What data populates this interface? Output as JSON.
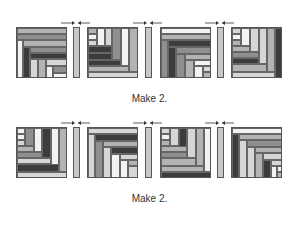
{
  "colors": {
    "white": "#f2f2f2",
    "light": "#d6d6d6",
    "mid": "#b3b3b3",
    "medium": "#8f8f8f",
    "dark": "#3c3c3c"
  },
  "rows": [
    {
      "caption": "Make 2.",
      "blocks": [
        {
          "name": "block-1",
          "x": 16,
          "y": 27,
          "w": 51,
          "h": 51,
          "pieces": [
            [
              0,
              0,
              51,
              6,
              "mid"
            ],
            [
              0,
              6,
              51,
              6,
              "medium"
            ],
            [
              0,
              12,
              6,
              39,
              "white"
            ],
            [
              6,
              12,
              45,
              7,
              "mid"
            ],
            [
              6,
              19,
              7,
              32,
              "dark"
            ],
            [
              13,
              19,
              38,
              6,
              "medium"
            ],
            [
              13,
              25,
              38,
              6,
              "dark"
            ],
            [
              13,
              31,
              8,
              20,
              "light"
            ],
            [
              21,
              31,
              8,
              20,
              "mid"
            ],
            [
              29,
              31,
              22,
              7,
              "light"
            ],
            [
              29,
              38,
              7,
              13,
              "white"
            ],
            [
              36,
              38,
              15,
              7,
              "medium"
            ],
            [
              36,
              45,
              15,
              6,
              "white"
            ]
          ]
        },
        {
          "name": "block-2",
          "x": 87,
          "y": 27,
          "w": 51,
          "h": 51,
          "pieces": [
            [
              0,
              0,
              9,
              6,
              "mid"
            ],
            [
              0,
              6,
              9,
              6,
              "white"
            ],
            [
              0,
              12,
              9,
              6,
              "light"
            ],
            [
              9,
              0,
              8,
              18,
              "white"
            ],
            [
              17,
              0,
              7,
              18,
              "light"
            ],
            [
              0,
              18,
              24,
              7,
              "dark"
            ],
            [
              0,
              25,
              24,
              7,
              "dark"
            ],
            [
              24,
              0,
              9,
              32,
              "medium"
            ],
            [
              33,
              0,
              8,
              38,
              "white"
            ],
            [
              0,
              32,
              33,
              6,
              "dark"
            ],
            [
              0,
              38,
              41,
              6,
              "mid"
            ],
            [
              41,
              0,
              10,
              44,
              "mid"
            ],
            [
              0,
              44,
              51,
              7,
              "light"
            ]
          ]
        },
        {
          "name": "block-3",
          "x": 160,
          "y": 27,
          "w": 51,
          "h": 51,
          "pieces": [
            [
              0,
              0,
              51,
              6,
              "white"
            ],
            [
              0,
              6,
              51,
              6,
              "mid"
            ],
            [
              0,
              12,
              7,
              39,
              "medium"
            ],
            [
              7,
              12,
              44,
              7,
              "dark"
            ],
            [
              7,
              19,
              8,
              32,
              "dark"
            ],
            [
              15,
              19,
              36,
              7,
              "medium"
            ],
            [
              15,
              26,
              9,
              25,
              "medium"
            ],
            [
              24,
              26,
              27,
              6,
              "mid"
            ],
            [
              24,
              32,
              9,
              19,
              "mid"
            ],
            [
              33,
              32,
              18,
              6,
              "white"
            ],
            [
              33,
              38,
              9,
              13,
              "white"
            ],
            [
              42,
              38,
              9,
              6,
              "light"
            ],
            [
              42,
              44,
              9,
              7,
              "mid"
            ]
          ]
        },
        {
          "name": "block-4",
          "x": 231,
          "y": 27,
          "w": 51,
          "h": 51,
          "pieces": [
            [
              0,
              0,
              9,
              6,
              "light"
            ],
            [
              0,
              6,
              9,
              6,
              "white"
            ],
            [
              0,
              12,
              9,
              6,
              "mid"
            ],
            [
              9,
              0,
              9,
              18,
              "white"
            ],
            [
              18,
              0,
              9,
              24,
              "light"
            ],
            [
              0,
              18,
              18,
              6,
              "mid"
            ],
            [
              0,
              24,
              27,
              6,
              "medium"
            ],
            [
              27,
              0,
              8,
              36,
              "light"
            ],
            [
              0,
              30,
              27,
              6,
              "dark"
            ],
            [
              35,
              0,
              8,
              44,
              "mid"
            ],
            [
              0,
              36,
              35,
              8,
              "mid"
            ],
            [
              43,
              0,
              8,
              51,
              "dark"
            ],
            [
              0,
              44,
              43,
              7,
              "light"
            ]
          ]
        }
      ],
      "strips": [
        {
          "x": 73,
          "y": 27
        },
        {
          "x": 145,
          "y": 27
        },
        {
          "x": 217,
          "y": 27
        }
      ],
      "caption_y": 93
    },
    {
      "caption": "Make 2.",
      "blocks": [
        {
          "name": "block-5",
          "x": 16,
          "y": 127,
          "w": 51,
          "h": 51,
          "pieces": [
            [
              0,
              0,
              8,
              6,
              "white"
            ],
            [
              0,
              6,
              8,
              6,
              "white"
            ],
            [
              0,
              12,
              8,
              6,
              "light"
            ],
            [
              8,
              0,
              9,
              18,
              "medium"
            ],
            [
              17,
              0,
              8,
              24,
              "white"
            ],
            [
              0,
              18,
              17,
              6,
              "mid"
            ],
            [
              25,
              0,
              9,
              30,
              "dark"
            ],
            [
              0,
              24,
              25,
              6,
              "medium"
            ],
            [
              0,
              30,
              34,
              6,
              "light"
            ],
            [
              34,
              0,
              8,
              44,
              "white"
            ],
            [
              0,
              36,
              42,
              8,
              "dark"
            ],
            [
              42,
              0,
              9,
              44,
              "mid"
            ],
            [
              0,
              44,
              51,
              7,
              "light"
            ]
          ]
        },
        {
          "name": "block-6",
          "x": 87,
          "y": 127,
          "w": 51,
          "h": 51,
          "pieces": [
            [
              0,
              0,
              51,
              6,
              "light"
            ],
            [
              0,
              6,
              7,
              45,
              "light"
            ],
            [
              7,
              6,
              44,
              7,
              "dark"
            ],
            [
              7,
              13,
              8,
              38,
              "medium"
            ],
            [
              15,
              13,
              36,
              6,
              "mid"
            ],
            [
              15,
              19,
              8,
              32,
              "light"
            ],
            [
              23,
              19,
              28,
              7,
              "dark"
            ],
            [
              23,
              26,
              9,
              25,
              "white"
            ],
            [
              32,
              26,
              19,
              6,
              "light"
            ],
            [
              32,
              32,
              8,
              19,
              "white"
            ],
            [
              40,
              32,
              11,
              6,
              "mid"
            ],
            [
              40,
              38,
              11,
              13,
              "light"
            ]
          ]
        },
        {
          "name": "block-7",
          "x": 160,
          "y": 127,
          "w": 51,
          "h": 51,
          "pieces": [
            [
              0,
              0,
              9,
              6,
              "light"
            ],
            [
              0,
              6,
              9,
              6,
              "white"
            ],
            [
              0,
              12,
              9,
              6,
              "mid"
            ],
            [
              9,
              0,
              9,
              18,
              "light"
            ],
            [
              18,
              0,
              8,
              24,
              "dark"
            ],
            [
              0,
              18,
              26,
              6,
              "mid"
            ],
            [
              0,
              24,
              26,
              6,
              "medium"
            ],
            [
              26,
              0,
              9,
              30,
              "light"
            ],
            [
              35,
              0,
              8,
              38,
              "mid"
            ],
            [
              0,
              30,
              35,
              8,
              "mid"
            ],
            [
              43,
              0,
              8,
              44,
              "white"
            ],
            [
              0,
              38,
              43,
              6,
              "mid"
            ],
            [
              0,
              44,
              51,
              7,
              "dark"
            ]
          ]
        },
        {
          "name": "block-8",
          "x": 231,
          "y": 127,
          "w": 51,
          "h": 51,
          "pieces": [
            [
              0,
              0,
              51,
              6,
              "white"
            ],
            [
              0,
              6,
              7,
              45,
              "dark"
            ],
            [
              7,
              6,
              44,
              6,
              "mid"
            ],
            [
              7,
              12,
              8,
              39,
              "light"
            ],
            [
              15,
              12,
              36,
              7,
              "medium"
            ],
            [
              15,
              19,
              8,
              32,
              "light"
            ],
            [
              23,
              19,
              28,
              6,
              "mid"
            ],
            [
              23,
              25,
              8,
              26,
              "mid"
            ],
            [
              31,
              25,
              20,
              7,
              "light"
            ],
            [
              31,
              32,
              8,
              19,
              "dark"
            ],
            [
              39,
              32,
              12,
              6,
              "light"
            ],
            [
              39,
              38,
              6,
              13,
              "white"
            ],
            [
              45,
              38,
              6,
              6,
              "white"
            ],
            [
              45,
              44,
              6,
              7,
              "mid"
            ]
          ]
        }
      ],
      "strips": [
        {
          "x": 73,
          "y": 127
        },
        {
          "x": 145,
          "y": 127
        },
        {
          "x": 217,
          "y": 127
        }
      ],
      "caption_y": 193
    }
  ]
}
